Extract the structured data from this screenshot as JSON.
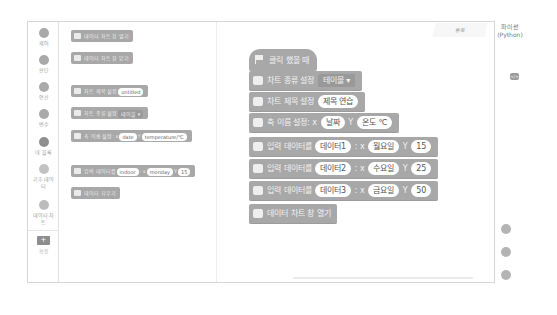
{
  "sidebar": {
    "categories": [
      {
        "label": "제어"
      },
      {
        "label": "판단"
      },
      {
        "label": "연산"
      },
      {
        "label": "변수"
      },
      {
        "label": "내 블록"
      },
      {
        "label": "기후 데이터"
      },
      {
        "label": "데이터 차트"
      }
    ],
    "add_label": "확장"
  },
  "palette": {
    "blocks": [
      {
        "text": "데이터 차트 창 열기"
      },
      {
        "text": "데이터 차트 창 닫기"
      },
      {
        "text": "차트 제목 설정",
        "value": "untitled"
      },
      {
        "text": "차트 종류 설정",
        "dropdown": "테이블 ▾"
      },
      {
        "text": "축 이름 설정: x",
        "x": "date",
        "y_label": "Y",
        "y": "temperature/℃"
      },
      {
        "text": "입력 데이터를",
        "series": "indoor",
        "x_label": ": x",
        "x": "monday",
        "y_label": "Y",
        "y": "15"
      },
      {
        "text": "데이터 지우기"
      }
    ]
  },
  "tabs": {
    "block": "블록",
    "python_line1": "파이썬",
    "python_line2": "(Python)"
  },
  "script": {
    "hat": "클릭 했을 때",
    "blocks": [
      {
        "text": "차트 종류 설정",
        "dropdown": "테이블 ▾"
      },
      {
        "text": "차트 제목 설정",
        "value": "제목 연습"
      },
      {
        "text": "축 이름 설정: x",
        "x": "날짜",
        "y_label": "Y",
        "y": "온도 ℃"
      },
      {
        "text": "입력 데이터를",
        "series": "데이터1",
        "x_label": ": x",
        "x": "월요일",
        "y_label": "Y",
        "y": "15"
      },
      {
        "text": "입력 데이터를",
        "series": "데이터2",
        "x_label": ": x",
        "x": "수요일",
        "y_label": "Y",
        "y": "25"
      },
      {
        "text": "입력 데이터를",
        "series": "데이터3",
        "x_label": ": x",
        "x": "금요일",
        "y_label": "Y",
        "y": "50"
      },
      {
        "text": "데이터 차트 창 열기"
      }
    ]
  },
  "code_icon": "</>",
  "add_icon": "+"
}
